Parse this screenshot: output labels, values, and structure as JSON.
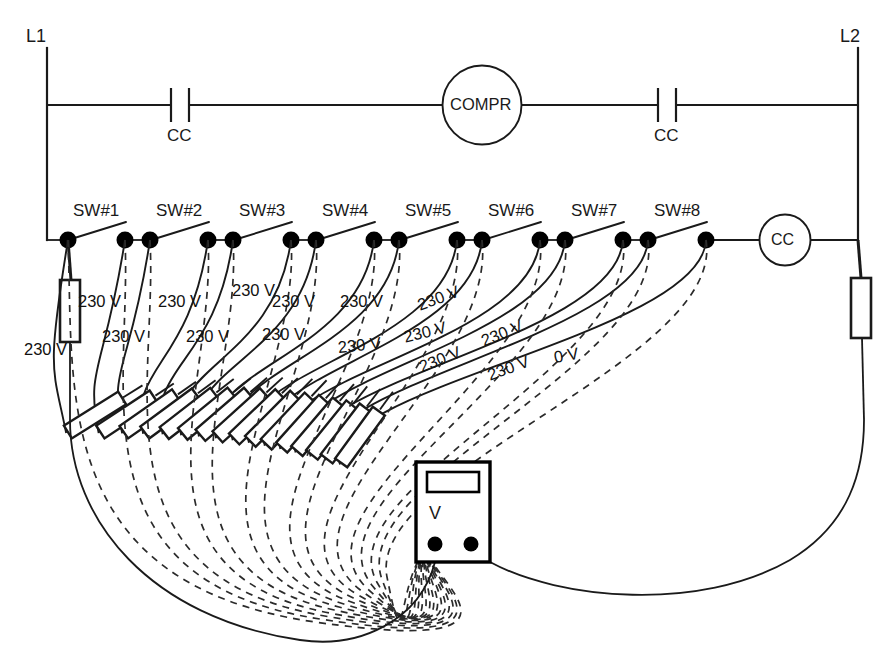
{
  "diagram": {
    "type": "electrical-ladder-diagram",
    "colors": {
      "line": "#1a1a1a",
      "node": "#000000",
      "dashed": "#2b2b2b",
      "background": "#ffffff"
    }
  },
  "rails": {
    "left_label": "L1",
    "right_label": "L2"
  },
  "power_rung": {
    "contact_left_label": "CC",
    "contact_right_label": "CC",
    "motor_label": "COMPR"
  },
  "control_rung": {
    "coil_label": "CC",
    "switches": [
      {
        "label": "SW#1"
      },
      {
        "label": "SW#2"
      },
      {
        "label": "SW#3"
      },
      {
        "label": "SW#4"
      },
      {
        "label": "SW#5"
      },
      {
        "label": "SW#6"
      },
      {
        "label": "SW#7"
      },
      {
        "label": "SW#8"
      }
    ]
  },
  "measurements": [
    {
      "id": 1,
      "value": "230 V"
    },
    {
      "id": 2,
      "value": "230 V"
    },
    {
      "id": 3,
      "value": "230 V"
    },
    {
      "id": 4,
      "value": "230 V"
    },
    {
      "id": 5,
      "value": "230 V"
    },
    {
      "id": 6,
      "value": "230 V"
    },
    {
      "id": 7,
      "value": "230 V"
    },
    {
      "id": 8,
      "value": "230 V"
    },
    {
      "id": 9,
      "value": "230 V"
    },
    {
      "id": 10,
      "value": "230 V"
    },
    {
      "id": 11,
      "value": "230 V"
    },
    {
      "id": 12,
      "value": "230 V"
    },
    {
      "id": 13,
      "value": "230 V"
    },
    {
      "id": 14,
      "value": "230 V"
    },
    {
      "id": 15,
      "value": "230 V"
    },
    {
      "id": 16,
      "value": "0 V"
    }
  ],
  "meter": {
    "label": "V",
    "display_value": ""
  }
}
